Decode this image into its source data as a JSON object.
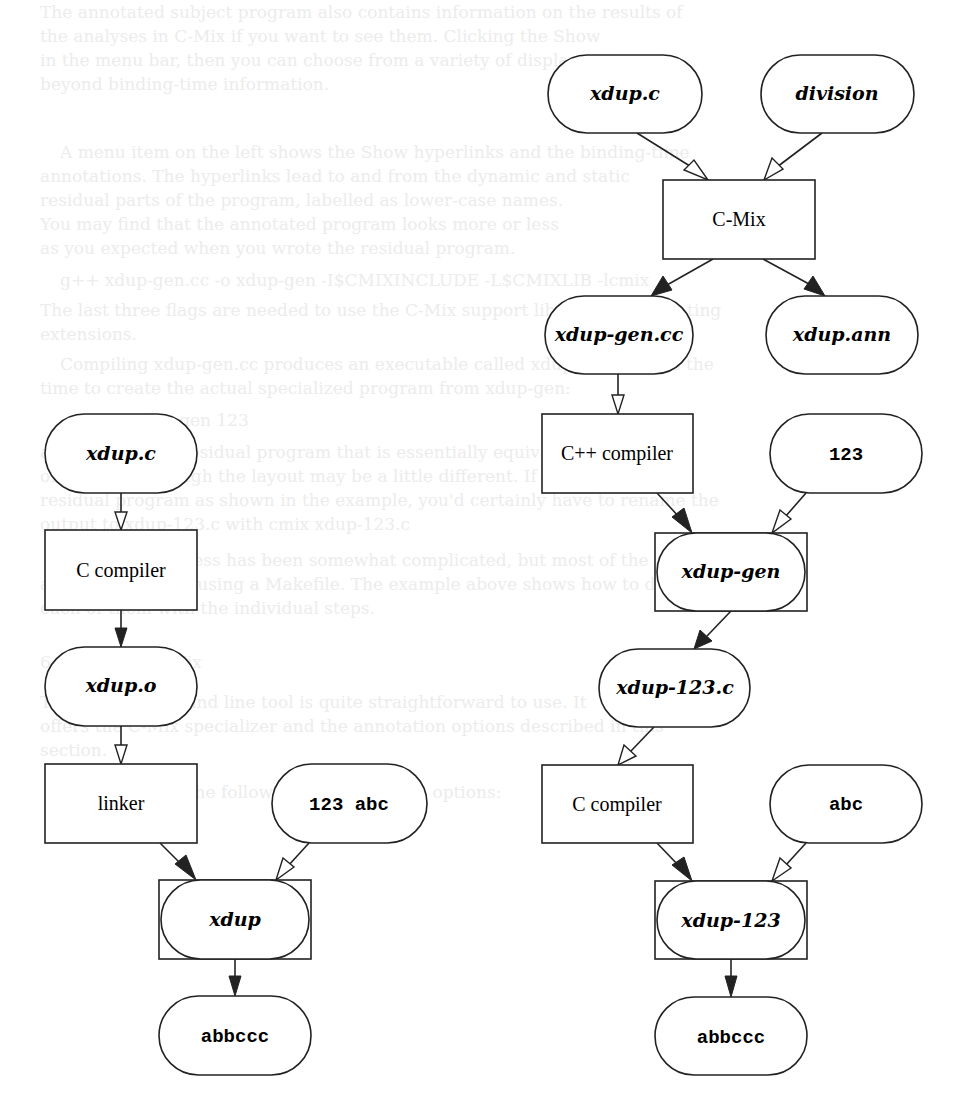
{
  "background_text": {
    "lines": [
      {
        "x": 40,
        "y": 0,
        "text": "The annotated subject program also contains information on the results of"
      },
      {
        "x": 40,
        "y": 24,
        "text": "the analyses in C-Mix if you want to see them. Clicking the Show"
      },
      {
        "x": 40,
        "y": 48,
        "text": "in the menu bar, then you can choose from a variety of display options"
      },
      {
        "x": 40,
        "y": 72,
        "text": "beyond binding-time information."
      },
      {
        "x": 60,
        "y": 140,
        "text": "A menu item on the left shows the Show hyperlinks and the binding-time"
      },
      {
        "x": 40,
        "y": 164,
        "text": "annotations. The hyperlinks lead to and from the dynamic and static"
      },
      {
        "x": 40,
        "y": 188,
        "text": "residual parts of the program, labelled as lower-case names."
      },
      {
        "x": 40,
        "y": 212,
        "text": "You may find that the annotated program looks more or less"
      },
      {
        "x": 40,
        "y": 236,
        "text": "as you expected when you wrote the residual program."
      },
      {
        "x": 60,
        "y": 268,
        "text": "g++ xdup-gen.cc -o xdup-gen -I$CMIXINCLUDE -L$CMIXLIB -lcmix"
      },
      {
        "x": 40,
        "y": 298,
        "text": "The last three flags are needed to use the C-Mix support library for generating"
      },
      {
        "x": 40,
        "y": 322,
        "text": "extensions."
      },
      {
        "x": 60,
        "y": 352,
        "text": "Compiling xdup-gen.cc produces an executable called xdup-gen. Now is the"
      },
      {
        "x": 40,
        "y": 376,
        "text": "time to create the actual specialized program from xdup-gen:"
      },
      {
        "x": 120,
        "y": 408,
        "text": "./xdup-gen 123"
      },
      {
        "x": 40,
        "y": 440,
        "text": "and it outputs a residual program that is essentially equivalent to the one"
      },
      {
        "x": 40,
        "y": 464,
        "text": "on page 113 though the layout may be a little different. If you had run the"
      },
      {
        "x": 40,
        "y": 488,
        "text": "residual program as shown in the example, you'd certainly have to rename the"
      },
      {
        "x": 40,
        "y": 512,
        "text": "output to xdup-123.c with cmix xdup-123.c"
      },
      {
        "x": 60,
        "y": 548,
        "text": "The whole process has been somewhat complicated, but most of the steps"
      },
      {
        "x": 40,
        "y": 572,
        "text": "are automated by using a Makefile. The example above shows how to do"
      },
      {
        "x": 40,
        "y": 596,
        "text": "each of them with the individual steps."
      },
      {
        "x": 40,
        "y": 650,
        "text": "6.1 Running C-Mix"
      },
      {
        "x": 40,
        "y": 690,
        "text": "The C-Mix command line tool is quite straightforward to use. It"
      },
      {
        "x": 40,
        "y": 714,
        "text": "offers the C-Mix specializer and the annotation options described in this"
      },
      {
        "x": 40,
        "y": 738,
        "text": "section."
      },
      {
        "x": 60,
        "y": 780,
        "text": "C-Mix accepts the following command line options:"
      }
    ]
  },
  "diagram": {
    "left_pipeline": {
      "nodes": [
        {
          "id": "L_src",
          "label": "xdup.c",
          "kind": "file",
          "style": "italic"
        },
        {
          "id": "L_cc",
          "label": "C compiler",
          "kind": "process",
          "style": "roman"
        },
        {
          "id": "L_obj",
          "label": "xdup.o",
          "kind": "file",
          "style": "italic"
        },
        {
          "id": "L_link",
          "label": "linker",
          "kind": "process",
          "style": "roman"
        },
        {
          "id": "L_in",
          "label": "123 abc",
          "kind": "data",
          "style": "mono"
        },
        {
          "id": "L_exe",
          "label": "xdup",
          "kind": "program",
          "style": "italic"
        },
        {
          "id": "L_out",
          "label": "abbccc",
          "kind": "data",
          "style": "mono"
        }
      ]
    },
    "right_pipeline": {
      "nodes": [
        {
          "id": "R_src",
          "label": "xdup.c",
          "kind": "file",
          "style": "italic"
        },
        {
          "id": "R_div",
          "label": "division",
          "kind": "file",
          "style": "italic"
        },
        {
          "id": "R_cmix",
          "label": "C-Mix",
          "kind": "process",
          "style": "roman"
        },
        {
          "id": "R_gencc",
          "label": "xdup-gen.cc",
          "kind": "file",
          "style": "italic"
        },
        {
          "id": "R_ann",
          "label": "xdup.ann",
          "kind": "file",
          "style": "italic"
        },
        {
          "id": "R_cxx",
          "label": "C++ compiler",
          "kind": "process",
          "style": "roman"
        },
        {
          "id": "R_123",
          "label": "123",
          "kind": "data",
          "style": "mono"
        },
        {
          "id": "R_gen",
          "label": "xdup-gen",
          "kind": "program",
          "style": "italic"
        },
        {
          "id": "R_res",
          "label": "xdup-123.c",
          "kind": "file",
          "style": "italic"
        },
        {
          "id": "R_cc",
          "label": "C compiler",
          "kind": "process",
          "style": "roman"
        },
        {
          "id": "R_abc",
          "label": "abc",
          "kind": "data",
          "style": "mono"
        },
        {
          "id": "R_exe",
          "label": "xdup-123",
          "kind": "program",
          "style": "italic"
        },
        {
          "id": "R_out",
          "label": "abbccc",
          "kind": "data",
          "style": "mono"
        }
      ]
    },
    "legend_notes": {
      "open_arrow": "input data flow",
      "filled_arrow": "produced by"
    }
  }
}
